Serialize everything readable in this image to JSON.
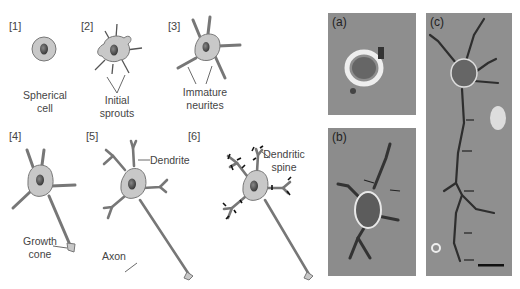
{
  "figure": {
    "stages": [
      {
        "id": "[1]",
        "caption": [
          "Spherical",
          "cell"
        ]
      },
      {
        "id": "[2]",
        "caption": [
          "Initial",
          "sprouts"
        ]
      },
      {
        "id": "[3]",
        "caption": [
          "Immature",
          "neurites"
        ]
      },
      {
        "id": "[4]",
        "caption": [
          "Growth",
          "cone"
        ]
      },
      {
        "id": "[5]",
        "labels": {
          "dendrite": "Dendrite",
          "axon": "Axon"
        }
      },
      {
        "id": "[6]",
        "caption": [
          "Dendritic",
          "spine"
        ]
      }
    ],
    "photos": [
      {
        "id": "(a)",
        "description": "Round neuron cell body, phase contrast"
      },
      {
        "id": "(b)",
        "description": "Neuron with sprouting neurites, arrows"
      },
      {
        "id": "(c)",
        "description": "Neuron with long axon, arrows and scale bar"
      }
    ],
    "colors": {
      "cell_fill": "#c8c8c8",
      "nucleus": "#555555",
      "outline": "#777777",
      "photo_bg": "#8c8c8c"
    }
  }
}
